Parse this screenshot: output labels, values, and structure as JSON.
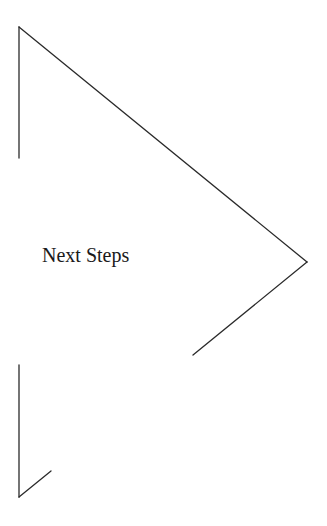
{
  "diagram": {
    "label": "Next Steps",
    "shape": "chevron-arrow-outline",
    "stroke_color": "#2a2a2a",
    "segments": [
      {
        "name": "left-top-vertical",
        "x1": 19,
        "y1": 27,
        "x2": 19,
        "y2": 158
      },
      {
        "name": "top-diagonal",
        "x1": 19,
        "y1": 27,
        "x2": 307,
        "y2": 262
      },
      {
        "name": "right-lower-diagonal",
        "x1": 307,
        "y1": 262,
        "x2": 193,
        "y2": 355
      },
      {
        "name": "left-bottom-vertical",
        "x1": 19,
        "y1": 365,
        "x2": 19,
        "y2": 497
      },
      {
        "name": "bottom-diagonal",
        "x1": 19,
        "y1": 497,
        "x2": 51,
        "y2": 471
      }
    ]
  }
}
